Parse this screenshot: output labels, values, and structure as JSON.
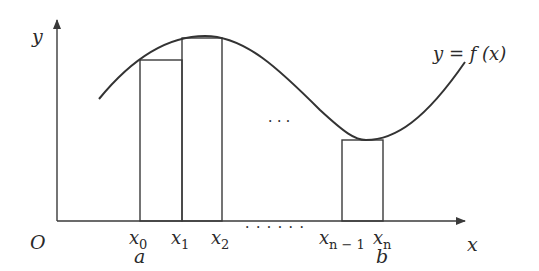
{
  "diagram": {
    "axes": {
      "origin_label": "O",
      "x_label": "x",
      "y_label": "y"
    },
    "curve_label": "y = f (x)",
    "partition_labels": [
      {
        "name": "x",
        "sub": "0"
      },
      {
        "name": "x",
        "sub": "1"
      },
      {
        "name": "x",
        "sub": "2"
      },
      {
        "name": "x",
        "sub": "n − 1"
      },
      {
        "name": "x",
        "sub": "n"
      }
    ],
    "endpoint_labels": {
      "a": "a",
      "b": "b"
    },
    "ellipsis_middle": "· · ·",
    "ellipsis_axis": "· · · · · ·",
    "rectangles": [
      {
        "from": "x0",
        "to": "x1"
      },
      {
        "from": "x1",
        "to": "x2"
      },
      {
        "from": "xn-1",
        "to": "xn"
      }
    ],
    "colors": {
      "line": "#3a3a3a",
      "text": "#2a2a2a",
      "background": "#ffffff"
    }
  }
}
